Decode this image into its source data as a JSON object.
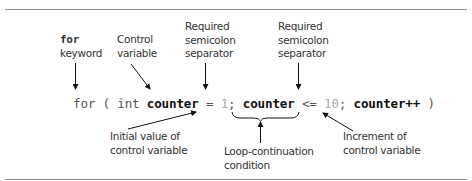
{
  "diagram": {
    "code": {
      "kw_for": "for",
      "open_paren": " ( ",
      "kw_int": "int",
      "space1": " ",
      "var_decl": "counter",
      "assign": " = ",
      "init_value": "1",
      "semi1": "; ",
      "var_cond": "counter",
      "op_le": " <= ",
      "final_value": "10",
      "semi2": "; ",
      "var_incr": "counter++",
      "close_paren": " )"
    },
    "annotations": {
      "for_keyword": {
        "line1": "for",
        "line2": "keyword"
      },
      "control_variable": {
        "line1": "Control",
        "line2": "variable"
      },
      "semicolon_1": {
        "line1": "Required",
        "line2": "semicolon",
        "line3": "separator"
      },
      "semicolon_2": {
        "line1": "Required",
        "line2": "semicolon",
        "line3": "separator"
      },
      "initial_value": {
        "line1": "Initial value of",
        "line2": "control variable"
      },
      "loop_condition": {
        "line1": "Loop-continuation",
        "line2": "condition"
      },
      "increment": {
        "line1": "Increment of",
        "line2": "control variable"
      }
    },
    "colors": {
      "rule": "#8a8a8a",
      "text": "#333333",
      "identifier": "#111111",
      "literal": "#aaaaaa",
      "arrow": "#111111"
    }
  }
}
